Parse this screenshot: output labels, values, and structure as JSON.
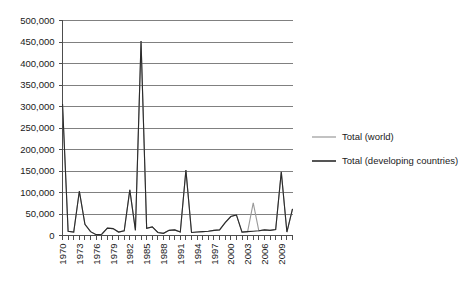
{
  "chart_data": {
    "type": "line",
    "title": "",
    "subtitle": "",
    "xlabel": "",
    "ylabel": "",
    "grid": true,
    "legend_position": "right",
    "ylim": [
      0,
      500000
    ],
    "ytick_step": 50000,
    "ytick_labels": [
      "0",
      "50,000",
      "100,000",
      "150,000",
      "200,000",
      "250,000",
      "300,000",
      "350,000",
      "400,000",
      "450,000",
      "500,000"
    ],
    "ytick_values": [
      0,
      50000,
      100000,
      150000,
      200000,
      250000,
      300000,
      350000,
      400000,
      450000,
      500000
    ],
    "x": [
      1970,
      1971,
      1972,
      1973,
      1974,
      1975,
      1976,
      1977,
      1978,
      1979,
      1980,
      1981,
      1982,
      1983,
      1984,
      1985,
      1986,
      1987,
      1988,
      1989,
      1990,
      1991,
      1992,
      1993,
      1994,
      1995,
      1996,
      1997,
      1998,
      1999,
      2000,
      2001,
      2002,
      2003,
      2004,
      2005,
      2006,
      2007,
      2008,
      2009,
      2010,
      2011
    ],
    "xtick_labels": [
      "1970",
      "1973",
      "1976",
      "1979",
      "1982",
      "1985",
      "1988",
      "1991",
      "1994",
      "1997",
      "2000",
      "2003",
      "2006",
      "2009"
    ],
    "xtick_values": [
      1970,
      1973,
      1976,
      1979,
      1982,
      1985,
      1988,
      1991,
      1994,
      1997,
      2000,
      2003,
      2006,
      2009
    ],
    "xlim": [
      1970,
      2011
    ],
    "series": [
      {
        "name": "Total (world)",
        "color": "#9a9a9a",
        "width": 1.1,
        "values": [
          307000,
          10000,
          8000,
          103000,
          26000,
          9000,
          2000,
          3000,
          17000,
          16000,
          8000,
          11000,
          106000,
          12000,
          452000,
          17000,
          20000,
          7000,
          5000,
          12000,
          13000,
          8000,
          152000,
          7000,
          8000,
          9000,
          10000,
          12000,
          13000,
          30000,
          44000,
          48000,
          8000,
          9000,
          76000,
          11000,
          13000,
          12000,
          14000,
          148000,
          8000,
          62000
        ]
      },
      {
        "name": "Total (developing countries)",
        "color": "#2b2b2b",
        "width": 1.1,
        "values": [
          307000,
          10000,
          8000,
          103000,
          26000,
          9000,
          2000,
          3000,
          17000,
          16000,
          8000,
          11000,
          106000,
          12000,
          452000,
          17000,
          20000,
          7000,
          5000,
          12000,
          13000,
          8000,
          152000,
          7000,
          8000,
          9000,
          10000,
          12000,
          13000,
          30000,
          44000,
          48000,
          8000,
          9000,
          10000,
          11000,
          13000,
          12000,
          14000,
          148000,
          8000,
          62000
        ]
      }
    ],
    "legend": [
      {
        "label": "Total (world)",
        "color": "#9a9a9a"
      },
      {
        "label": "Total (developing countries)",
        "color": "#2b2b2b"
      }
    ],
    "axis_color": "#4d4d4d",
    "grid_color": "#808080"
  }
}
